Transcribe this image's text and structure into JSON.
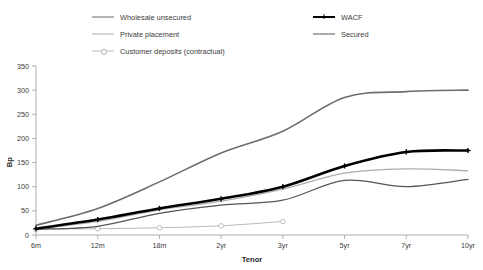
{
  "legend": {
    "left_items": [
      {
        "label": "Wholesale unsecured",
        "color": "#6d6d6d",
        "width": 1.6,
        "marker": "none"
      },
      {
        "label": "Private placement",
        "color": "#adadad",
        "width": 1.3,
        "marker": "none"
      },
      {
        "label": "Customer deposits (contractual)",
        "color": "#b9b9b9",
        "width": 1.0,
        "marker": "circle"
      }
    ],
    "right_items": [
      {
        "label": "WACF",
        "color": "#000000",
        "width": 2.6,
        "marker": "plus"
      },
      {
        "label": "Secured",
        "color": "#555555",
        "width": 1.3,
        "marker": "none"
      }
    ]
  },
  "chart_data": {
    "type": "line",
    "title": "",
    "xlabel": "Tenor",
    "ylabel": "Bp",
    "categories": [
      "6m",
      "12m",
      "18m",
      "2yr",
      "3yr",
      "5yr",
      "7yr",
      "10yr"
    ],
    "ylim": [
      0,
      350
    ],
    "yticks": [
      0,
      50,
      100,
      150,
      200,
      250,
      300,
      350
    ],
    "grid": false,
    "legend_position": "top",
    "series": [
      {
        "name": "Wholesale unsecured",
        "color": "#6d6d6d",
        "width": 1.6,
        "marker": "none",
        "values": [
          20,
          55,
          110,
          170,
          215,
          285,
          297,
          300
        ]
      },
      {
        "name": "WACF",
        "color": "#000000",
        "width": 2.6,
        "marker": "plus",
        "values": [
          13,
          32,
          55,
          75,
          100,
          143,
          172,
          175
        ]
      },
      {
        "name": "Private placement",
        "color": "#adadad",
        "width": 1.3,
        "marker": "none",
        "values": [
          12,
          28,
          52,
          70,
          95,
          128,
          137,
          133
        ]
      },
      {
        "name": "Secured",
        "color": "#555555",
        "width": 1.3,
        "marker": "none",
        "values": [
          12,
          18,
          45,
          62,
          72,
          113,
          100,
          115
        ]
      },
      {
        "name": "Customer deposits (contractual)",
        "color": "#b9b9b9",
        "width": 1.0,
        "marker": "circle",
        "values": [
          12,
          13,
          15,
          19,
          28,
          null,
          null,
          null
        ]
      }
    ]
  }
}
